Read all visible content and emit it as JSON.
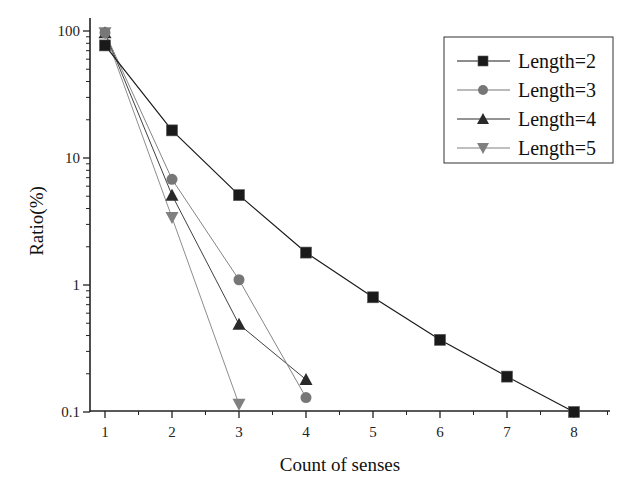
{
  "chart_data": {
    "type": "line",
    "title": "",
    "xlabel": "Count of senses",
    "ylabel": "Ratio(%)",
    "yscale": "log",
    "xlim": [
      0.8,
      8.5
    ],
    "ylim": [
      0.1,
      100
    ],
    "x_ticks": [
      "1",
      "2",
      "3",
      "4",
      "5",
      "6",
      "7",
      "8"
    ],
    "y_ticks": [
      "0.1",
      "1",
      "10",
      "100"
    ],
    "grid": false,
    "legend_position": "upper right",
    "series": [
      {
        "name": "Length=2",
        "marker": "square",
        "color": "#1a1a1a",
        "x": [
          1,
          2,
          3,
          4,
          5,
          6,
          7,
          8
        ],
        "values": [
          77,
          16.5,
          5.1,
          1.8,
          0.8,
          0.37,
          0.19,
          0.1
        ]
      },
      {
        "name": "Length=3",
        "marker": "circle",
        "color": "#777777",
        "x": [
          1,
          2,
          3,
          4
        ],
        "values": [
          97,
          6.8,
          1.1,
          0.13
        ]
      },
      {
        "name": "Length=4",
        "marker": "triangle-up",
        "color": "#2a2a2a",
        "x": [
          1,
          2,
          3,
          4
        ],
        "values": [
          97,
          5.1,
          0.49,
          0.18
        ]
      },
      {
        "name": "Length=5",
        "marker": "triangle-down",
        "color": "#808080",
        "x": [
          1,
          2,
          3
        ],
        "values": [
          97,
          3.4,
          0.115
        ]
      }
    ]
  }
}
